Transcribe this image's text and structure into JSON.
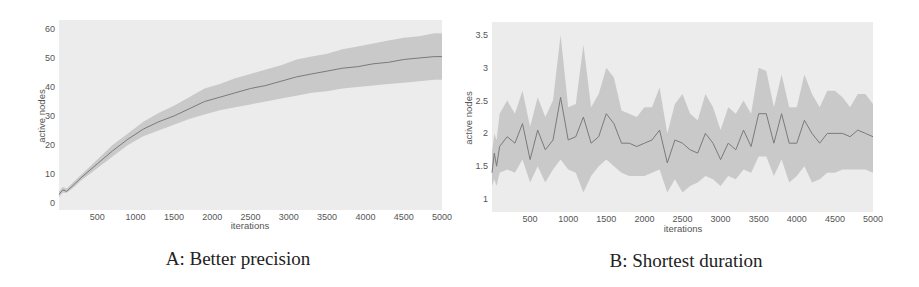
{
  "chart_data": [
    {
      "id": "A",
      "type": "line",
      "caption": "A: Better precision",
      "title": "",
      "xlabel": "iterations",
      "ylabel": "active nodes",
      "xlim": [
        0,
        5000
      ],
      "ylim": [
        0,
        62
      ],
      "xticks": [
        500,
        1000,
        1500,
        2000,
        2500,
        3000,
        3500,
        4000,
        4500,
        5000
      ],
      "yticks": [
        0,
        10,
        20,
        30,
        40,
        50,
        60
      ],
      "grid": false,
      "shaded_band": true,
      "series": [
        {
          "name": "mean",
          "x": [
            0,
            50,
            100,
            200,
            300,
            500,
            700,
            900,
            1100,
            1300,
            1500,
            1700,
            1900,
            2100,
            2300,
            2500,
            2700,
            2900,
            3100,
            3300,
            3500,
            3700,
            3900,
            4100,
            4300,
            4500,
            4700,
            4900,
            5000
          ],
          "values": [
            3,
            4.5,
            4,
            6.5,
            9,
            13.5,
            18,
            22,
            25.5,
            28,
            30,
            32.5,
            35,
            36.5,
            38,
            39.5,
            40.5,
            42,
            43.5,
            44.5,
            45.5,
            46.5,
            47,
            48,
            48.5,
            49.5,
            50,
            50.5,
            50.5
          ],
          "lower": [
            2,
            3.5,
            3.5,
            5.5,
            8,
            12,
            16,
            20,
            23,
            25,
            27,
            29,
            30.5,
            32,
            33,
            34,
            35,
            36,
            37,
            38,
            38.5,
            39.5,
            40,
            40.5,
            41,
            41.5,
            42,
            42.5,
            42.5
          ],
          "upper": [
            4,
            5.5,
            5,
            7.5,
            10,
            15,
            20,
            24,
            28,
            31,
            33.5,
            36.5,
            39.5,
            41,
            43,
            44.5,
            46,
            47.5,
            49.5,
            50.5,
            51.5,
            53,
            54,
            55,
            56,
            57,
            57.5,
            58.5,
            58.5
          ]
        }
      ]
    },
    {
      "id": "B",
      "type": "line",
      "caption": "B: Shortest duration",
      "title": "",
      "xlabel": "iterations",
      "ylabel": "active nodes",
      "xlim": [
        0,
        5000
      ],
      "ylim": [
        0.9,
        3.6
      ],
      "xticks": [
        500,
        1000,
        1500,
        2000,
        2500,
        3000,
        3500,
        4000,
        4500,
        5000
      ],
      "yticks": [
        1,
        1.5,
        2,
        2.5,
        3,
        3.5
      ],
      "ytick_labels": [
        "1",
        "1.5",
        "2",
        "2.5",
        "3",
        "3.5"
      ],
      "grid": false,
      "shaded_band": true,
      "series": [
        {
          "name": "mean",
          "x": [
            0,
            30,
            60,
            100,
            200,
            300,
            400,
            500,
            600,
            700,
            800,
            900,
            1000,
            1100,
            1200,
            1300,
            1400,
            1500,
            1600,
            1700,
            1800,
            1900,
            2000,
            2100,
            2200,
            2300,
            2400,
            2500,
            2600,
            2700,
            2800,
            2900,
            3000,
            3100,
            3200,
            3300,
            3400,
            3500,
            3600,
            3700,
            3800,
            3900,
            4000,
            4100,
            4200,
            4300,
            4400,
            4500,
            4600,
            4700,
            4800,
            4900,
            5000
          ],
          "values": [
            1.4,
            1.7,
            1.5,
            1.8,
            1.95,
            1.85,
            2.15,
            1.6,
            2.05,
            1.75,
            1.9,
            2.55,
            1.9,
            1.95,
            2.25,
            1.85,
            1.95,
            2.3,
            2.15,
            1.85,
            1.85,
            1.8,
            1.85,
            1.9,
            2.05,
            1.55,
            1.9,
            1.85,
            1.75,
            1.7,
            2.0,
            1.85,
            1.6,
            1.85,
            1.75,
            2.05,
            1.8,
            2.3,
            2.3,
            1.85,
            2.3,
            1.85,
            1.85,
            2.2,
            2.0,
            1.85,
            2.0,
            2.0,
            2.0,
            1.95,
            2.05,
            2.0,
            1.95
          ],
          "lower": [
            1.2,
            1.3,
            1.2,
            1.4,
            1.45,
            1.4,
            1.6,
            1.25,
            1.5,
            1.25,
            1.45,
            1.6,
            1.45,
            1.4,
            1.1,
            1.35,
            1.5,
            1.6,
            1.5,
            1.4,
            1.35,
            1.35,
            1.35,
            1.4,
            1.45,
            1.1,
            1.3,
            1.1,
            1.2,
            1.25,
            1.35,
            1.3,
            1.2,
            1.35,
            1.3,
            1.45,
            1.4,
            1.65,
            1.65,
            1.35,
            1.6,
            1.25,
            1.35,
            1.5,
            1.25,
            1.3,
            1.4,
            1.4,
            1.45,
            1.45,
            1.45,
            1.45,
            1.4
          ],
          "upper": [
            1.7,
            2.0,
            1.9,
            2.3,
            2.5,
            2.3,
            2.65,
            2.1,
            2.55,
            2.25,
            2.5,
            3.5,
            2.4,
            2.45,
            3.35,
            2.4,
            2.6,
            3.0,
            2.85,
            2.35,
            2.3,
            2.25,
            2.4,
            2.4,
            2.7,
            2.0,
            2.45,
            2.6,
            2.3,
            2.2,
            2.6,
            2.4,
            2.05,
            2.4,
            2.3,
            2.5,
            2.3,
            3.0,
            2.95,
            2.4,
            2.9,
            2.4,
            2.4,
            2.9,
            2.6,
            2.4,
            2.65,
            2.65,
            2.55,
            2.4,
            2.6,
            2.6,
            2.45
          ]
        }
      ]
    }
  ],
  "colors": {
    "plot_background": "#ececec",
    "band": "#bdbdbd",
    "line": "#7a7a7a",
    "tick_text": "#555555",
    "caption_text": "#222222"
  }
}
